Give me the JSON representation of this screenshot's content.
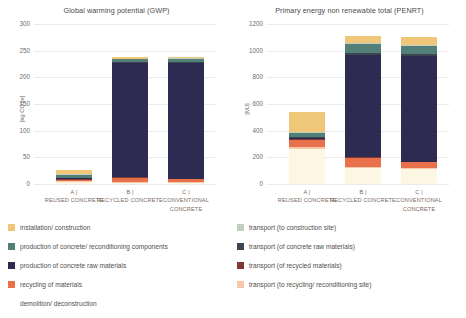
{
  "chart_data": [
    {
      "type": "bar",
      "stacked": true,
      "title": "Global warming potential (GWP)",
      "xlabel": "",
      "ylabel": "[kg CO2e]",
      "ylim": [
        0,
        300
      ],
      "yticks": [
        0,
        50,
        100,
        150,
        200,
        250,
        300
      ],
      "grid": true,
      "legend_position": "bottom",
      "categories": [
        "A | REUSED CONCRETE",
        "B | RECYCLED CONCRETE",
        "C | CONVENTIONAL CONCRETE"
      ],
      "series": [
        {
          "name": "demolition/ deconstruction",
          "color": "#fdf6e3",
          "values": [
            3,
            2,
            2
          ]
        },
        {
          "name": "transport (to recycling/ reconditioning site)",
          "color": "#f6c9ad",
          "values": [
            2,
            2,
            2
          ]
        },
        {
          "name": "recycling of materials",
          "color": "#e8704a",
          "values": [
            3,
            8,
            6
          ]
        },
        {
          "name": "transport (of recycled materials)",
          "color": "#7d3a37",
          "values": [
            1,
            1,
            0
          ]
        },
        {
          "name": "production of concrete raw materials",
          "color": "#2e2b52",
          "values": [
            2,
            213,
            217
          ]
        },
        {
          "name": "transport (of concrete raw materials)",
          "color": "#3d4550",
          "values": [
            1,
            2,
            2
          ]
        },
        {
          "name": "production of concrete/ reconditioning components",
          "color": "#527f77",
          "values": [
            4,
            6,
            6
          ]
        },
        {
          "name": "transport (to construction site)",
          "color": "#c3cfbe",
          "values": [
            2,
            1,
            1
          ]
        },
        {
          "name": "installation/ construction",
          "color": "#f0c679",
          "values": [
            9,
            3,
            3
          ]
        }
      ]
    },
    {
      "type": "bar",
      "stacked": true,
      "title": "Primary energy non renewable total (PENRT)",
      "xlabel": "",
      "ylabel": "[MJ]",
      "ylim": [
        0,
        1200
      ],
      "yticks": [
        0,
        200,
        400,
        600,
        800,
        1000,
        1200
      ],
      "grid": true,
      "legend_position": "bottom",
      "categories": [
        "A | REUSED CONCRETE",
        "B | RECYCLED CONCRETE",
        "C | CONVENTIONAL CONCRETE"
      ],
      "series": [
        {
          "name": "demolition/ deconstruction",
          "color": "#fdf6e3",
          "values": [
            260,
            120,
            110
          ]
        },
        {
          "name": "transport (to recycling/ reconditioning site)",
          "color": "#f6c9ad",
          "values": [
            15,
            10,
            8
          ]
        },
        {
          "name": "recycling of materials",
          "color": "#e8704a",
          "values": [
            55,
            65,
            45
          ]
        },
        {
          "name": "transport (of recycled materials)",
          "color": "#7d3a37",
          "values": [
            5,
            5,
            0
          ]
        },
        {
          "name": "production of concrete raw materials",
          "color": "#2e2b52",
          "values": [
            10,
            770,
            800
          ]
        },
        {
          "name": "transport (of concrete raw materials)",
          "color": "#3d4550",
          "values": [
            5,
            10,
            10
          ]
        },
        {
          "name": "production of concrete/ reconditioning components",
          "color": "#527f77",
          "values": [
            30,
            70,
            65
          ]
        },
        {
          "name": "transport (to construction site)",
          "color": "#c3cfbe",
          "values": [
            8,
            8,
            8
          ]
        },
        {
          "name": "installation/ construction",
          "color": "#f0c679",
          "values": [
            152,
            55,
            55
          ]
        }
      ]
    }
  ],
  "legend": {
    "left_column": [
      {
        "label": "installation/ construction",
        "color": "#f0c679"
      },
      {
        "label": "production of concrete/ reconditioning components",
        "color": "#527f77"
      },
      {
        "label": "production of concrete raw materials",
        "color": "#2e2b52"
      },
      {
        "label": "recycling of materials",
        "color": "#e8704a"
      },
      {
        "label": "demolition/ deconstruction",
        "color": "#fdf6e3"
      }
    ],
    "right_column": [
      {
        "label": "transport (to construction site)",
        "color": "#c3cfbe"
      },
      {
        "label": "transport (of concrete raw materials)",
        "color": "#3d4550"
      },
      {
        "label": "transport (of recycled materials)",
        "color": "#7d3a37"
      },
      {
        "label": "transport (to recycling/ reconditioning site)",
        "color": "#f6c9ad"
      }
    ]
  }
}
